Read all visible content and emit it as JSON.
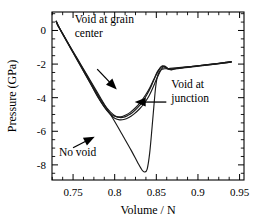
{
  "chart_data": {
    "type": "line",
    "title": "",
    "xlabel": "Volume  /  N",
    "ylabel": "Pressure (GPa)",
    "xlim": [
      0.7247,
      0.9553
    ],
    "ylim": [
      -8.9,
      1.1
    ],
    "grid": false,
    "legend_position": "inline-annotations",
    "xticks": [
      0.75,
      0.8,
      0.85,
      0.9,
      0.95
    ],
    "xticklabels": [
      "0.75",
      "0.8",
      "0.85",
      "0.9",
      "0.95"
    ],
    "xtick_minor_step": 0.0125,
    "yticks": [
      0,
      -2,
      -4,
      -6,
      -8
    ],
    "yticklabels": [
      "0",
      "-2",
      "-4",
      "-6",
      "-8"
    ],
    "ytick_minor_step": 0.5,
    "series": [
      {
        "name": "No void",
        "x": [
          0.7298,
          0.731,
          0.7325,
          0.74,
          0.75,
          0.76,
          0.77,
          0.78,
          0.79,
          0.8,
          0.81,
          0.82,
          0.828,
          0.833,
          0.836,
          0.839,
          0.842,
          0.845,
          0.847,
          0.849,
          0.851,
          0.854,
          0.857,
          0.86,
          0.865,
          0.87,
          0.88,
          0.89,
          0.9,
          0.91,
          0.92,
          0.93,
          0.94
        ],
        "y": [
          0.55,
          0.35,
          0.22,
          -0.4,
          -1.25,
          -2.08,
          -2.92,
          -3.76,
          -4.6,
          -5.42,
          -6.28,
          -7.15,
          -7.9,
          -8.32,
          -8.42,
          -8.25,
          -7.3,
          -5.7,
          -4.55,
          -3.45,
          -2.8,
          -2.42,
          -2.3,
          -2.28,
          -2.26,
          -2.24,
          -2.2,
          -2.15,
          -2.1,
          -2.04,
          -1.99,
          -1.92,
          -1.86
        ]
      },
      {
        "name": "Void at grain center",
        "x": [
          0.7298,
          0.732,
          0.74,
          0.75,
          0.76,
          0.77,
          0.78,
          0.788,
          0.795,
          0.801,
          0.806,
          0.811,
          0.816,
          0.821,
          0.827,
          0.833,
          0.839,
          0.844,
          0.849,
          0.853,
          0.856,
          0.859,
          0.862,
          0.867,
          0.872,
          0.88,
          0.89,
          0.9,
          0.91,
          0.92,
          0.93,
          0.94
        ],
        "y": [
          0.55,
          0.28,
          -0.42,
          -1.28,
          -2.12,
          -2.98,
          -3.86,
          -4.46,
          -4.86,
          -5.1,
          -5.18,
          -5.16,
          -5.05,
          -4.9,
          -4.62,
          -4.28,
          -3.8,
          -3.3,
          -2.72,
          -2.36,
          -2.18,
          -2.12,
          -2.2,
          -2.34,
          -2.28,
          -2.22,
          -2.16,
          -2.1,
          -2.04,
          -1.98,
          -1.92,
          -1.86
        ]
      },
      {
        "name": "Void at junction",
        "x": [
          0.7298,
          0.732,
          0.74,
          0.75,
          0.76,
          0.77,
          0.779,
          0.787,
          0.794,
          0.8,
          0.806,
          0.811,
          0.817,
          0.823,
          0.83,
          0.836,
          0.841,
          0.846,
          0.85,
          0.854,
          0.857,
          0.86,
          0.864,
          0.87,
          0.878,
          0.888,
          0.898,
          0.908,
          0.918,
          0.928,
          0.94
        ],
        "y": [
          0.55,
          0.3,
          -0.45,
          -1.33,
          -2.2,
          -3.08,
          -3.9,
          -4.52,
          -4.96,
          -5.22,
          -5.32,
          -5.3,
          -5.18,
          -4.98,
          -4.66,
          -4.3,
          -3.92,
          -3.4,
          -2.92,
          -2.5,
          -2.24,
          -2.12,
          -2.26,
          -2.3,
          -2.26,
          -2.2,
          -2.14,
          -2.08,
          -2.02,
          -1.96,
          -1.88
        ]
      },
      {
        "name": "Void curve third",
        "x": [
          0.7298,
          0.733,
          0.742,
          0.752,
          0.762,
          0.772,
          0.78,
          0.787,
          0.793,
          0.7985,
          0.804,
          0.809,
          0.814,
          0.819,
          0.825,
          0.831,
          0.837,
          0.842,
          0.847,
          0.851,
          0.8545,
          0.8575,
          0.861,
          0.866,
          0.874,
          0.884,
          0.896,
          0.908,
          0.92,
          0.932,
          0.94
        ],
        "y": [
          0.55,
          0.22,
          -0.58,
          -1.48,
          -2.36,
          -3.24,
          -3.96,
          -4.5,
          -4.88,
          -5.08,
          -5.14,
          -5.12,
          -5.02,
          -4.86,
          -4.6,
          -4.26,
          -3.84,
          -3.42,
          -2.9,
          -2.48,
          -2.22,
          -2.1,
          -2.22,
          -2.32,
          -2.26,
          -2.2,
          -2.13,
          -2.06,
          -2.0,
          -1.93,
          -1.87
        ]
      }
    ],
    "annotations": [
      {
        "name": "void-at-grain-center",
        "text_lines": [
          "Void at grain",
          "center"
        ],
        "text_x": 0.752,
        "text_y": 0.45,
        "arrow_from_x": 0.779,
        "arrow_from_y": -2.3,
        "arrow_to_x": 0.8025,
        "arrow_to_y": -3.52
      },
      {
        "name": "void-at-junction",
        "text_lines": [
          "Void at",
          "junction"
        ],
        "text_x": 0.868,
        "text_y": -3.45,
        "arrow_from_x": 0.862,
        "arrow_from_y": -4.26,
        "arrow_to_x": 0.824,
        "arrow_to_y": -4.26
      },
      {
        "name": "no-void",
        "text_lines": [
          "No void"
        ],
        "text_x": 0.733,
        "text_y": -7.45,
        "arrow_from_x": 0.75,
        "arrow_from_y": -6.98,
        "arrow_to_x": 0.776,
        "arrow_to_y": -6.32
      }
    ]
  }
}
